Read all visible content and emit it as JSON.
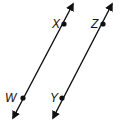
{
  "diagram": {
    "type": "parallel-lines",
    "stroke_color": "#111111",
    "lines": [
      {
        "name": "line-WX",
        "start": [
          13,
          118
        ],
        "end": [
          73,
          4
        ],
        "points": [
          {
            "label": "X",
            "x": 64,
            "y": 24,
            "label_x": 53,
            "label_y": 28
          },
          {
            "label": "W",
            "x": 23,
            "y": 98,
            "label_x": 6,
            "label_y": 102
          }
        ]
      },
      {
        "name": "line-YZ",
        "start": [
          53,
          118
        ],
        "end": [
          112,
          4
        ],
        "points": [
          {
            "label": "Z",
            "x": 103,
            "y": 24,
            "label_x": 91,
            "label_y": 28
          },
          {
            "label": "Y",
            "x": 62,
            "y": 98,
            "label_x": 50,
            "label_y": 102
          }
        ]
      }
    ],
    "labels": {
      "X": "X",
      "W": "W",
      "Z": "Z",
      "Y": "Y"
    }
  }
}
